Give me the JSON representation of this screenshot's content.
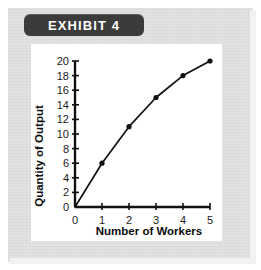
{
  "banner": {
    "label": "EXHIBIT 4"
  },
  "chart_data": {
    "type": "line",
    "title": "EXHIBIT 4",
    "xlabel": "Number of Workers",
    "ylabel": "Quantity of Output",
    "x": [
      0,
      1,
      2,
      3,
      4,
      5
    ],
    "values": [
      0,
      6,
      11,
      15,
      18,
      20
    ],
    "series": [
      {
        "name": "Total Product",
        "values": [
          0,
          6,
          11,
          15,
          18,
          20
        ]
      }
    ],
    "xlim": [
      0,
      5
    ],
    "ylim": [
      0,
      20
    ],
    "xticks": [
      "0",
      "1",
      "2",
      "3",
      "4",
      "5"
    ],
    "yticks": [
      "0",
      "2",
      "4",
      "6",
      "8",
      "10",
      "12",
      "14",
      "16",
      "18",
      "20"
    ],
    "grid": false,
    "legend": false,
    "markers": "filled-circle",
    "line_color": "#111111",
    "marker_color": "#111111"
  },
  "colors": {
    "banner_background": "#3b3b3b",
    "banner_text": "#ffffff",
    "paper_background": "#e2e2e0",
    "panel_background": "#ffffff",
    "axis": "#111111"
  }
}
